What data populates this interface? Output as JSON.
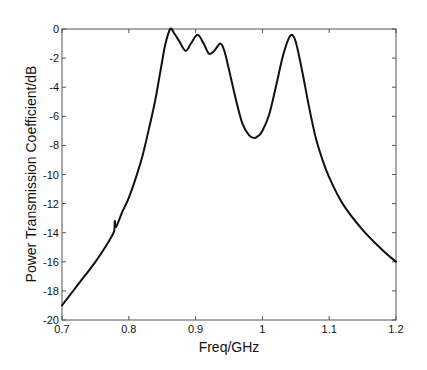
{
  "chart_data": {
    "type": "line",
    "title": "",
    "xlabel": "Freq/GHz",
    "ylabel": "Power Transmission Coefficient/dB",
    "xlim": [
      0.7,
      1.2
    ],
    "ylim": [
      -20,
      0
    ],
    "xticks": [
      0.7,
      0.8,
      0.9,
      1,
      1.1,
      1.2
    ],
    "xtick_labels": [
      "0.7",
      "0.8",
      "0.9",
      "1",
      "1.1",
      "1.2"
    ],
    "yticks": [
      0,
      -2,
      -4,
      -6,
      -8,
      -10,
      -12,
      -14,
      -16,
      -18,
      -20
    ],
    "ytick_labels": [
      "0",
      "-2",
      "-4",
      "-6",
      "-8",
      "-10",
      "-12",
      "-14",
      "-16",
      "-18",
      "-20"
    ],
    "grid": false,
    "legend": null,
    "series": [
      {
        "name": "S21",
        "color": "#111111",
        "x": [
          0.7,
          0.72,
          0.75,
          0.77,
          0.778,
          0.779,
          0.781,
          0.79,
          0.8,
          0.81,
          0.82,
          0.83,
          0.84,
          0.845,
          0.85,
          0.855,
          0.862,
          0.868,
          0.875,
          0.885,
          0.893,
          0.903,
          0.912,
          0.92,
          0.928,
          0.937,
          0.943,
          0.95,
          0.96,
          0.97,
          0.98,
          0.988,
          0.995,
          1.0,
          1.01,
          1.02,
          1.03,
          1.038,
          1.044,
          1.05,
          1.06,
          1.07,
          1.08,
          1.09,
          1.1,
          1.12,
          1.15,
          1.18,
          1.2
        ],
        "values": [
          -19.0,
          -17.8,
          -16.0,
          -14.6,
          -13.9,
          -13.2,
          -13.6,
          -12.6,
          -11.6,
          -10.3,
          -8.8,
          -6.9,
          -4.8,
          -3.5,
          -2.2,
          -1.0,
          0.0,
          -0.3,
          -0.8,
          -1.5,
          -1.0,
          -0.4,
          -1.0,
          -1.7,
          -1.5,
          -1.0,
          -1.5,
          -2.8,
          -4.8,
          -6.5,
          -7.3,
          -7.5,
          -7.3,
          -7.0,
          -5.9,
          -4.0,
          -2.0,
          -0.8,
          -0.4,
          -0.9,
          -3.0,
          -5.4,
          -7.5,
          -9.0,
          -10.2,
          -12.0,
          -13.8,
          -15.2,
          -16.0
        ]
      }
    ]
  },
  "axes": {
    "x_label": "Freq/GHz",
    "y_label": "Power Transmission Coefficient/dB"
  }
}
